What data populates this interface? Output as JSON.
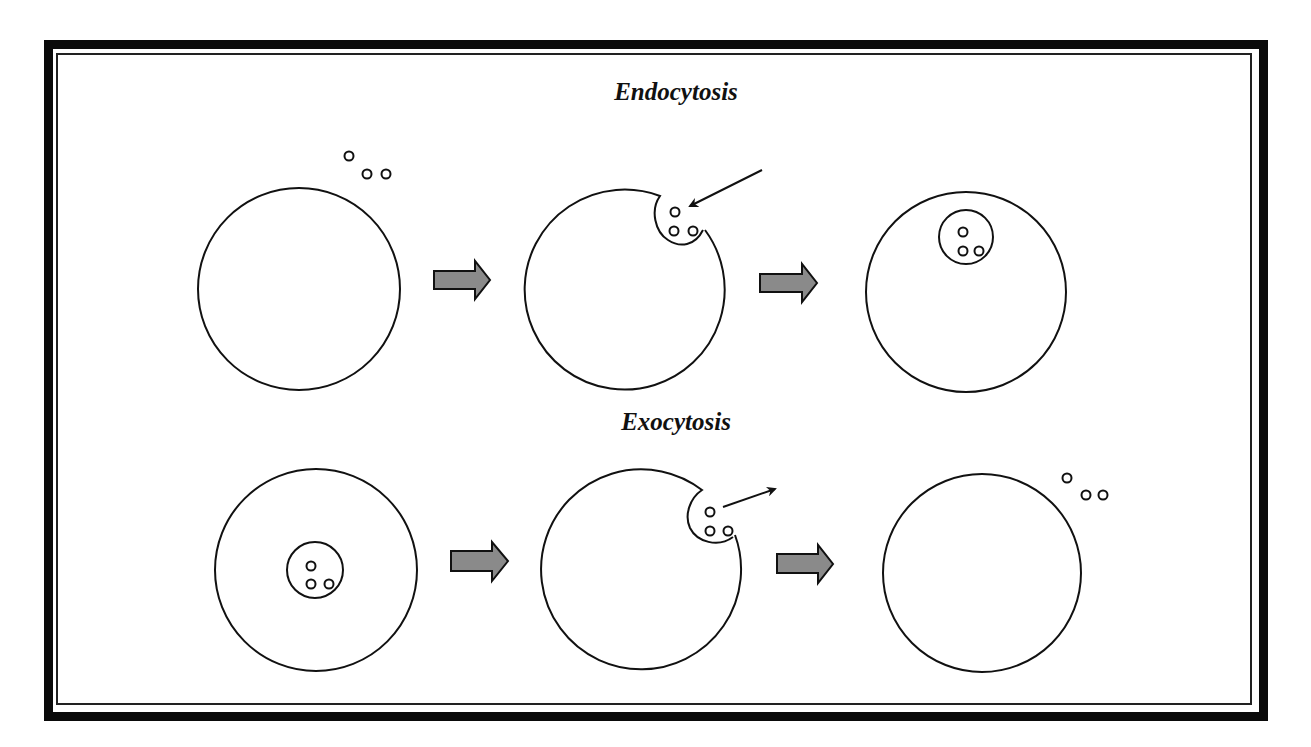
{
  "diagram": {
    "endocytosis": {
      "title": "Endocytosis",
      "stages": [
        {
          "name": "extracellular-particles-near-cell",
          "circle": {
            "cx": 299,
            "cy": 289,
            "r": 101
          }
        },
        {
          "name": "membrane-invagination",
          "circle": {
            "cx": 625,
            "cy": 291,
            "r": 100
          }
        },
        {
          "name": "internal-vesicle",
          "circle": {
            "cx": 966,
            "cy": 292,
            "r": 100
          }
        }
      ]
    },
    "exocytosis": {
      "title": "Exocytosis",
      "stages": [
        {
          "name": "internal-vesicle",
          "circle": {
            "cx": 316,
            "cy": 570,
            "r": 101
          }
        },
        {
          "name": "vesicle-fusion-release",
          "circle": {
            "cx": 642,
            "cy": 570,
            "r": 100
          }
        },
        {
          "name": "released-particles",
          "circle": {
            "cx": 982,
            "cy": 573,
            "r": 99
          }
        }
      ]
    },
    "colors": {
      "stroke": "#111111",
      "step_arrow_fill": "#8a8a8a",
      "background": "#ffffff"
    }
  }
}
